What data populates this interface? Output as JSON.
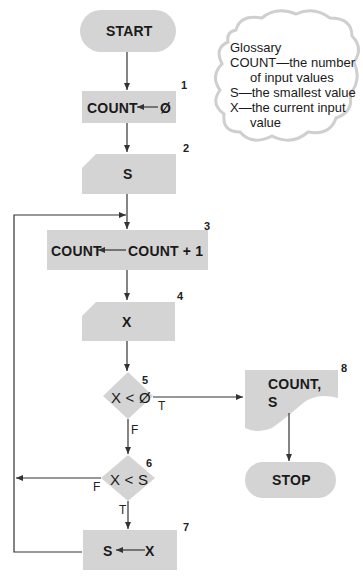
{
  "diagram": {
    "type": "flowchart",
    "colors": {
      "shape_fill": "#d4d4d4",
      "line": "#333333",
      "cloud_outline": "#cfcfcf"
    },
    "nodes": {
      "start": {
        "label": "START",
        "shape": "terminal"
      },
      "n1": {
        "number": "1",
        "label_left": "COUNT",
        "label_right": "Ø",
        "shape": "process"
      },
      "n2": {
        "number": "2",
        "label": "S",
        "shape": "input"
      },
      "n3": {
        "number": "3",
        "label_left": "COUNT",
        "label_right": "COUNT + 1",
        "shape": "process"
      },
      "n4": {
        "number": "4",
        "label": "X",
        "shape": "input"
      },
      "n5": {
        "number": "5",
        "label": "X < Ø",
        "shape": "decision",
        "true_label": "T",
        "false_label": "F"
      },
      "n6": {
        "number": "6",
        "label": "X < S",
        "shape": "decision",
        "true_label": "T",
        "false_label": "F"
      },
      "n7": {
        "number": "7",
        "label_left": "S",
        "label_right": "X",
        "shape": "process"
      },
      "n8": {
        "number": "8",
        "label_line1": "COUNT,",
        "label_line2": "S",
        "shape": "document"
      },
      "stop": {
        "label": "STOP",
        "shape": "terminal"
      }
    },
    "glossary": {
      "title": "Glossary",
      "entries": [
        {
          "term": "COUNT",
          "line1": "—the number",
          "line2": "of input values"
        },
        {
          "term": "S",
          "line1": "—the smallest value"
        },
        {
          "term": "X",
          "line1": "—the current input",
          "line2": "value"
        }
      ]
    }
  }
}
